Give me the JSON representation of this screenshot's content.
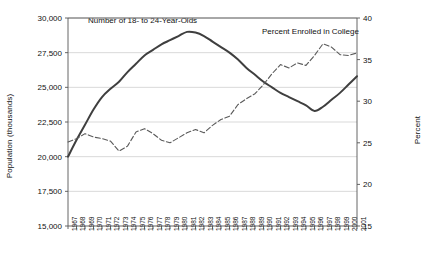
{
  "chart_data": {
    "type": "line",
    "title": "",
    "xlabel": "",
    "ylabel": "Population (thousands)",
    "ylabel_right": "Percent",
    "ylim": [
      15000,
      30000
    ],
    "ylim_right": [
      15,
      40
    ],
    "yticks": [
      "15,000",
      "17,500",
      "20,000",
      "22,500",
      "25,000",
      "27,500",
      "30,000"
    ],
    "ytick_values": [
      15000,
      17500,
      20000,
      22500,
      25000,
      27500,
      30000
    ],
    "yticks_right": [
      "15",
      "20",
      "25",
      "30",
      "35",
      "40"
    ],
    "ytick_values_right": [
      15,
      20,
      25,
      30,
      35,
      40
    ],
    "grid": true,
    "legend_position": "inline-annotations",
    "x": [
      1967,
      1968,
      1969,
      1970,
      1971,
      1972,
      1973,
      1974,
      1975,
      1976,
      1977,
      1978,
      1979,
      1980,
      1981,
      1982,
      1983,
      1984,
      1985,
      1986,
      1987,
      1988,
      1989,
      1990,
      1991,
      1992,
      1993,
      1994,
      1995,
      1996,
      1997,
      1998,
      1999,
      2000,
      2001
    ],
    "categories": [
      "1967",
      "1968",
      "1969",
      "1970",
      "1971",
      "1972",
      "1973",
      "1974",
      "1975",
      "1976",
      "1977",
      "1978",
      "1979",
      "1980",
      "1981",
      "1982",
      "1983",
      "1984",
      "1985",
      "1986",
      "1987",
      "1988",
      "1989",
      "1990",
      "1991",
      "1992",
      "1993",
      "1994",
      "1995",
      "1996",
      "1997",
      "1998",
      "1999",
      "2000",
      "2001"
    ],
    "series": [
      {
        "name": "Number of 18- to 24-Year-Olds",
        "axis": "left",
        "style": "solid",
        "color": "#3f3f3f",
        "unit": "thousands",
        "values": [
          20000,
          21200,
          22300,
          23400,
          24300,
          24900,
          25400,
          26100,
          26700,
          27300,
          27700,
          28100,
          28400,
          28700,
          29000,
          28950,
          28700,
          28300,
          27900,
          27500,
          27000,
          26400,
          25900,
          25400,
          25000,
          24600,
          24300,
          24000,
          23700,
          23300,
          23600,
          24100,
          24600,
          25200,
          25800
        ]
      },
      {
        "name": "Percent Enrolled in College",
        "axis": "right",
        "style": "dashed",
        "color": "#5a5a5a",
        "unit": "percent",
        "values": [
          25.1,
          25.5,
          26.1,
          25.7,
          25.5,
          25.2,
          24.0,
          24.6,
          26.3,
          26.7,
          26.1,
          25.3,
          25.0,
          25.6,
          26.2,
          26.6,
          26.2,
          27.1,
          27.8,
          28.2,
          29.6,
          30.3,
          30.9,
          32.0,
          33.3,
          34.4,
          34.0,
          34.6,
          34.3,
          35.5,
          36.9,
          36.5,
          35.6,
          35.5,
          35.8
        ]
      }
    ],
    "annotations": [
      {
        "text": "Number of 18- to 24-Year-Olds",
        "x_px": 88,
        "y_px": 16
      },
      {
        "text": "Percent Enrolled in College",
        "x_px": 262,
        "y_px": 27
      }
    ],
    "plot_area": {
      "left": 68,
      "right": 357,
      "top": 18,
      "bottom": 226
    }
  }
}
